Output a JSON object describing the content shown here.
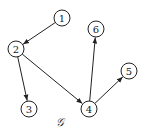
{
  "graph": {
    "label": "𝒢",
    "label_pos": [
      60,
      122
    ],
    "node_radius": 8,
    "nodes": [
      {
        "id": "1",
        "label": "1",
        "x": 62,
        "y": 18
      },
      {
        "id": "2",
        "label": "2",
        "x": 16,
        "y": 49
      },
      {
        "id": "3",
        "label": "3",
        "x": 29,
        "y": 109
      },
      {
        "id": "4",
        "label": "4",
        "x": 89,
        "y": 109
      },
      {
        "id": "5",
        "label": "5",
        "x": 129,
        "y": 71
      },
      {
        "id": "6",
        "label": "6",
        "x": 96,
        "y": 29
      }
    ],
    "edges": [
      {
        "from": "1",
        "to": "2"
      },
      {
        "from": "2",
        "to": "3"
      },
      {
        "from": "2",
        "to": "4"
      },
      {
        "from": "4",
        "to": "6"
      },
      {
        "from": "4",
        "to": "5"
      }
    ],
    "colors": {
      "stroke": "#222222",
      "background": "#ffffff"
    }
  }
}
